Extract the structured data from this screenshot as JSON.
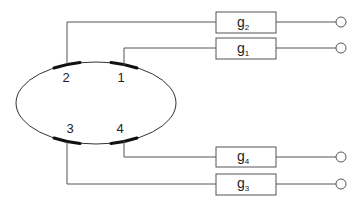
{
  "diagram": {
    "electrodes": [
      {
        "id": "1",
        "label": "1"
      },
      {
        "id": "2",
        "label": "2"
      },
      {
        "id": "3",
        "label": "3"
      },
      {
        "id": "4",
        "label": "4"
      }
    ],
    "conductances": [
      {
        "id": "g2",
        "base": "g",
        "sub": "2",
        "electrode": "2"
      },
      {
        "id": "g1",
        "base": "g",
        "sub": "1",
        "electrode": "1"
      },
      {
        "id": "g4",
        "base": "g",
        "sub": "4",
        "electrode": "4"
      },
      {
        "id": "g3",
        "base": "g",
        "sub": "3",
        "electrode": "3"
      }
    ],
    "colors": {
      "line": "#555555",
      "electrode": "#111111",
      "background": "#ffffff"
    }
  }
}
